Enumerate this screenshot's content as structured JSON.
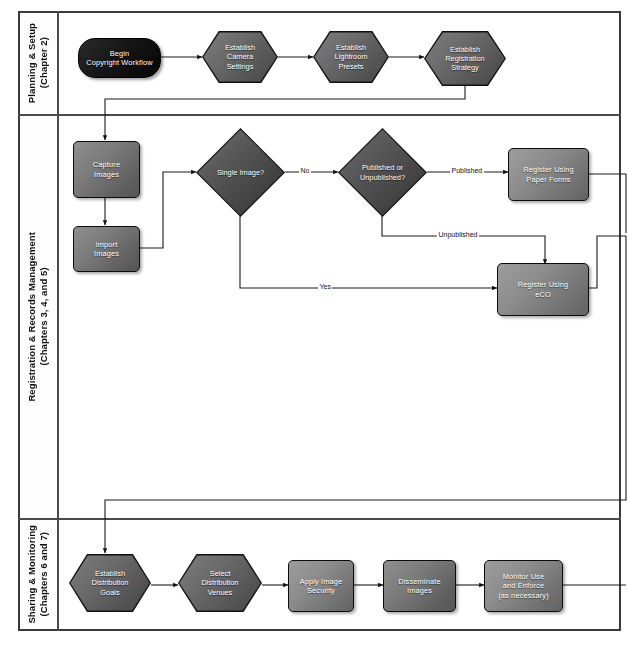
{
  "diagram": {
    "lanes": [
      {
        "id": "planning",
        "label": "Planning & Setup\n(Chapter 2)",
        "nodes": [
          {
            "id": "begin",
            "label": "Begin\nCopyright Workflow",
            "shape": "terminator"
          },
          {
            "id": "camera",
            "label": "Establish\nCamera\nSettings",
            "shape": "hexagon"
          },
          {
            "id": "lightroom",
            "label": "Establish\nLightroom\nPresets",
            "shape": "hexagon"
          },
          {
            "id": "registration",
            "label": "Establish\nRegistration\nStrategy",
            "shape": "hexagon"
          }
        ]
      },
      {
        "id": "registration-records",
        "label": "Registration & Records Management\n(Chapters 3, 4, and 5)",
        "nodes": [
          {
            "id": "capture",
            "label": "Capture\nImages",
            "shape": "process"
          },
          {
            "id": "import",
            "label": "Import\nImages",
            "shape": "process"
          },
          {
            "id": "single",
            "label": "Single Image?",
            "shape": "decision"
          },
          {
            "id": "pubunpub",
            "label": "Published or\nUnpublished?",
            "shape": "decision"
          },
          {
            "id": "paper",
            "label": "Register Using\nPaper Forms",
            "shape": "process"
          },
          {
            "id": "eco",
            "label": "Register Using\neCO",
            "shape": "process"
          }
        ]
      },
      {
        "id": "sharing",
        "label": "Sharing & Monitoring\n(Chapters 6 and 7)",
        "nodes": [
          {
            "id": "distgoals",
            "label": "Establish\nDistribution\nGoals",
            "shape": "hexagon"
          },
          {
            "id": "distvenues",
            "label": "Select\nDistribution\nVenues",
            "shape": "hexagon"
          },
          {
            "id": "security",
            "label": "Apply Image\nSecurity",
            "shape": "process"
          },
          {
            "id": "disseminate",
            "label": "Disseminate\nImages",
            "shape": "process"
          },
          {
            "id": "monitor",
            "label": "Monitor Use\nand Enforce\n(as necessary)",
            "shape": "process"
          }
        ]
      }
    ],
    "edge_labels": {
      "no": "No",
      "yes": "Yes",
      "published": "Published",
      "unpublished": "Unpublished"
    },
    "caption": ""
  }
}
